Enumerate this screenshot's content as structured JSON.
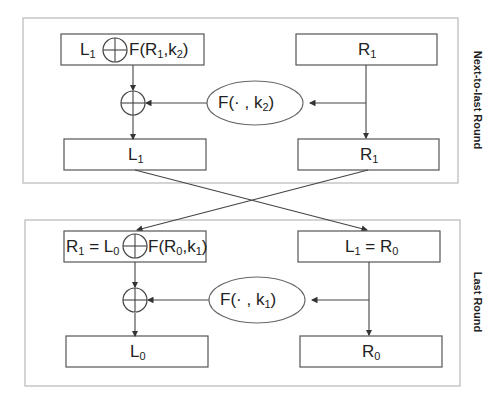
{
  "rounds": [
    {
      "label": "Next-to-last Round",
      "top_left_box": {
        "prefix": "L",
        "prefix_sub": "1",
        "suffix": "F(R",
        "suffix_sub": "1",
        "suffix_end": ",k",
        "suffix_end_sub": "2",
        "close": ")"
      },
      "top_right_box": {
        "text": "R",
        "sub": "1"
      },
      "function": {
        "text": "F(· , k",
        "sub": "2",
        "close": ")"
      },
      "bottom_left_box": {
        "text": "L",
        "sub": "1"
      },
      "bottom_right_box": {
        "text": "R",
        "sub": "1"
      }
    },
    {
      "label": "Last Round",
      "top_left_box": {
        "prefix": "R",
        "prefix_sub": "1",
        "eq": " = L",
        "eq_sub": "0",
        "suffix": "F(R",
        "suffix_sub": "0",
        "suffix_end": ",k",
        "suffix_end_sub": "1",
        "close": ")"
      },
      "top_right_box": {
        "text": "L",
        "sub": "1",
        "eq": " = R",
        "eq_sub": "0"
      },
      "function": {
        "text": "F(· , k",
        "sub": "1",
        "close": ")"
      },
      "bottom_left_box": {
        "text": "L",
        "sub": "0"
      },
      "bottom_right_box": {
        "text": "R",
        "sub": "0"
      }
    }
  ],
  "symbols": {
    "xor": "⊕"
  }
}
